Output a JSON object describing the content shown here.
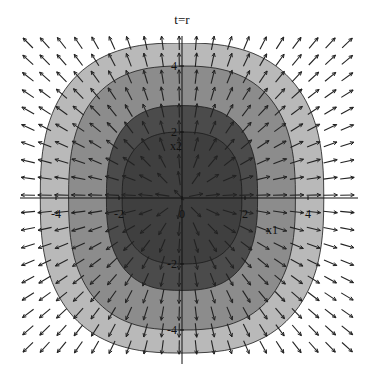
{
  "chart_data": {
    "type": "contour",
    "title": "t=r",
    "xlabel": "x1",
    "ylabel": "x2",
    "xlim": [
      -5.5,
      5.5
    ],
    "ylim": [
      -5,
      5
    ],
    "x_ticks": [
      {
        "label": "-4",
        "value": -4
      },
      {
        "label": "-2",
        "value": -2
      },
      {
        "label": "0",
        "value": 0
      },
      {
        "label": "2",
        "value": 2
      },
      {
        "label": "4",
        "value": 4
      }
    ],
    "y_ticks": [
      {
        "label": "4",
        "value": 4
      },
      {
        "label": "2",
        "value": 2
      },
      {
        "label": "-2",
        "value": -2
      },
      {
        "label": "-4",
        "value": -4
      }
    ],
    "contour_bands": [
      {
        "name": "outer",
        "color": "#b9b9b9",
        "rx": 4.5,
        "ry": 4.7
      },
      {
        "name": "middle",
        "color": "#8c8c8c",
        "rx": 3.6,
        "ry": 4.0
      },
      {
        "name": "inner",
        "color": "#4b4b4b",
        "rx": 2.4,
        "ry": 2.8
      },
      {
        "name": "core",
        "color": "#3f3f3f",
        "rx": 1.9,
        "ry": 2.0
      }
    ],
    "vector_field": {
      "description": "outward radial direction field, normalized arrows",
      "columns": 20,
      "rows": 19,
      "arrow_color": "#222222"
    },
    "grid": false,
    "legend": "none"
  }
}
